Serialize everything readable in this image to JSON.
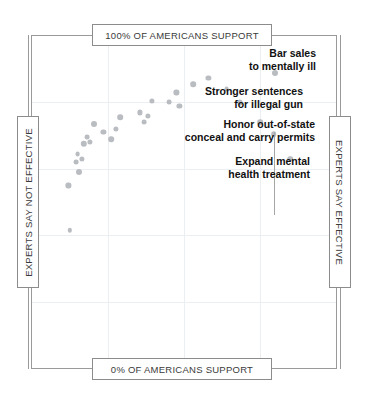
{
  "chart_data": {
    "type": "scatter",
    "title": "",
    "subtitle": "",
    "xlabel": "Americans' support",
    "ylabel": "Expert-rated effectiveness",
    "xlim": [
      0,
      100
    ],
    "ylim": [
      0,
      100
    ],
    "grid": true,
    "legend": "none",
    "axis_labels": {
      "top": "100% OF AMERICANS SUPPORT",
      "bottom": "0% OF AMERICANS SUPPORT",
      "left": "EXPERTS SAY NOT EFFECTIVE",
      "right": "EXPERTS SAY EFFECTIVE"
    },
    "axis_note": "Vertical axis = americans' support (top = 100%, bottom = 0%); horizontal axis = expert-rated effectiveness (left = not effective, right = effective).",
    "points": [
      {
        "x": 12.0,
        "y": 55.0,
        "r": 2.6
      },
      {
        "x": 14.5,
        "y": 62.0,
        "r": 2.4
      },
      {
        "x": 15.5,
        "y": 59.0,
        "r": 3.0
      },
      {
        "x": 15.0,
        "y": 64.5,
        "r": 2.4
      },
      {
        "x": 16.5,
        "y": 63.0,
        "r": 2.6
      },
      {
        "x": 17.0,
        "y": 67.5,
        "r": 3.2
      },
      {
        "x": 18.0,
        "y": 69.5,
        "r": 2.4
      },
      {
        "x": 19.0,
        "y": 68.0,
        "r": 2.6
      },
      {
        "x": 20.5,
        "y": 73.5,
        "r": 3.0
      },
      {
        "x": 23.5,
        "y": 71.0,
        "r": 2.6
      },
      {
        "x": 26.0,
        "y": 69.0,
        "r": 2.8
      },
      {
        "x": 27.5,
        "y": 72.0,
        "r": 2.6
      },
      {
        "x": 29.0,
        "y": 75.5,
        "r": 2.8
      },
      {
        "x": 35.5,
        "y": 77.0,
        "r": 2.6
      },
      {
        "x": 37.0,
        "y": 74.0,
        "r": 2.4
      },
      {
        "x": 38.0,
        "y": 76.0,
        "r": 2.6
      },
      {
        "x": 39.5,
        "y": 80.5,
        "r": 2.6
      },
      {
        "x": 45.0,
        "y": 80.0,
        "r": 2.4
      },
      {
        "x": 47.5,
        "y": 83.0,
        "r": 2.6
      },
      {
        "x": 48.5,
        "y": 79.0,
        "r": 2.6
      },
      {
        "x": 53.0,
        "y": 85.5,
        "r": 2.8
      },
      {
        "x": 58.0,
        "y": 87.5,
        "r": 2.6
      },
      {
        "x": 64.0,
        "y": 84.0,
        "r": 2.4
      },
      {
        "x": 68.5,
        "y": 80.0,
        "r": 2.6
      },
      {
        "x": 75.0,
        "y": 74.0,
        "r": 2.8
      },
      {
        "x": 79.5,
        "y": 70.5,
        "r": 2.8
      },
      {
        "x": 80.0,
        "y": 89.0,
        "r": 3.0
      },
      {
        "x": 85.0,
        "y": 63.0,
        "r": 2.8
      },
      {
        "x": 12.5,
        "y": 41.5,
        "r": 2.2
      }
    ],
    "annotations": [
      {
        "id": "bar-sales-to-mentally-ill",
        "text": "Bar sales\nto mentally ill",
        "lines": [
          "Bar sales",
          "to mentally ill"
        ],
        "align": "right",
        "point": {
          "x": 80.0,
          "y": 89.0
        }
      },
      {
        "id": "stronger-sentences-for-illegal-gun",
        "text": "Stronger sentences\nfor illegal gun",
        "lines": [
          "Stronger sentences",
          "for illegal gun"
        ],
        "align": "right",
        "point": {
          "x": 68.5,
          "y": 80.0
        }
      },
      {
        "id": "honor-out-of-state-conceal-and-carry-permits",
        "text": "Honor out-of-state\nconceal and carry permits",
        "lines": [
          "Honor out-of-state",
          "conceal and carry permits"
        ],
        "align": "right",
        "point": {
          "x": 75.0,
          "y": 74.0
        }
      },
      {
        "id": "expand-mental-health-treatment",
        "text": "Expand mental\nhealth treatment",
        "lines": [
          "Expand mental",
          "health treatment"
        ],
        "align": "right",
        "point": {
          "x": 79.5,
          "y": 70.5
        }
      }
    ],
    "colors": {
      "dot": "#b9bcc0",
      "frame": "#9a9a9a",
      "grid": "#eceff1",
      "text": "#111111",
      "box_border": "#8c8c8c"
    }
  }
}
